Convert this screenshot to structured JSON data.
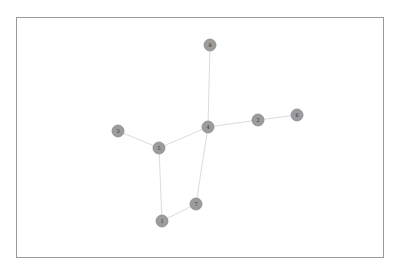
{
  "diagram": {
    "type": "network-graph",
    "frame": {
      "x": 16,
      "y": 17,
      "width": 367,
      "height": 240
    },
    "style": {
      "node_fill": "#9c9c9c",
      "node_stroke": "#8a8a8a",
      "edge_color": "#dcdcdc",
      "frame_color": "#9a9a9a",
      "label_color": "#333333",
      "node_radius": 6
    },
    "nodes": [
      {
        "id": "8",
        "label": "8",
        "x": 210,
        "y": 45
      },
      {
        "id": "4",
        "label": "4",
        "x": 208,
        "y": 127
      },
      {
        "id": "2",
        "label": "2",
        "x": 258,
        "y": 120
      },
      {
        "id": "6",
        "label": "6",
        "x": 297,
        "y": 115
      },
      {
        "id": "3",
        "label": "3",
        "x": 118,
        "y": 131
      },
      {
        "id": "5",
        "label": "5",
        "x": 159,
        "y": 148
      },
      {
        "id": "7",
        "label": "7",
        "x": 196,
        "y": 204
      },
      {
        "id": "1",
        "label": "1",
        "x": 162,
        "y": 221
      }
    ],
    "edges": [
      {
        "source": "8",
        "target": "4"
      },
      {
        "source": "4",
        "target": "2"
      },
      {
        "source": "2",
        "target": "6"
      },
      {
        "source": "4",
        "target": "5"
      },
      {
        "source": "3",
        "target": "5"
      },
      {
        "source": "5",
        "target": "1"
      },
      {
        "source": "4",
        "target": "7"
      },
      {
        "source": "7",
        "target": "1"
      }
    ]
  }
}
